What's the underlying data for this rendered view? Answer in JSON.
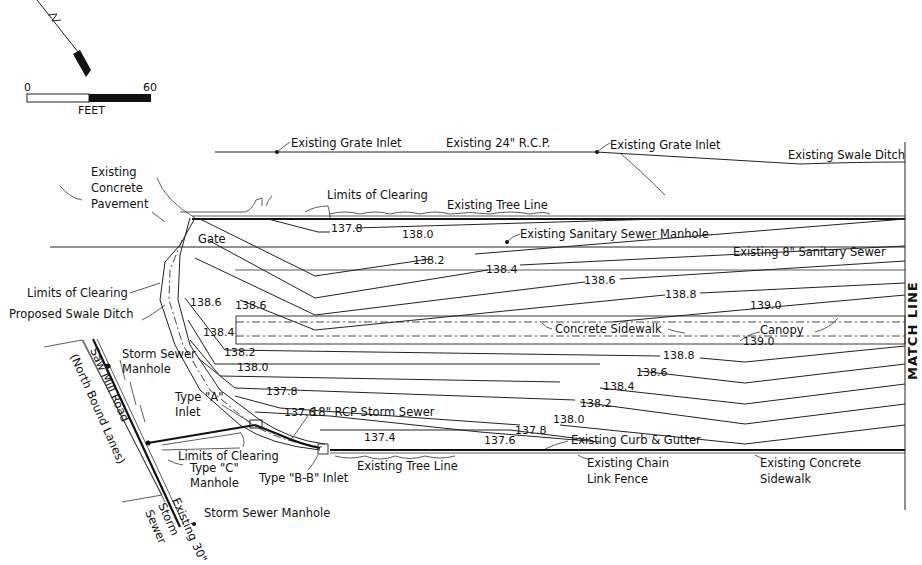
{
  "north_arrow": {
    "letter": "N"
  },
  "scale_bar": {
    "start": "0",
    "end": "60",
    "unit": "FEET"
  },
  "labels": {
    "existing_grate_inlet_1": "Existing Grate Inlet",
    "existing_24_rcp": "Existing 24\" R.C.P.",
    "existing_grate_inlet_2": "Existing Grate Inlet",
    "existing_swale_ditch": "Existing Swale Ditch",
    "existing_concrete_pavement": [
      "Existing",
      "Concrete",
      "Pavement"
    ],
    "limits_of_clearing_top": "Limits of Clearing",
    "existing_tree_line_top": "Existing Tree Line",
    "gate": "Gate",
    "existing_sanitary_sewer_manhole": "Existing Sanitary Sewer Manhole",
    "existing_8_sanitary_sewer": "Existing 8\" Sanitary Sewer",
    "limits_of_clearing_left": "Limits of Clearing",
    "proposed_swale_ditch": "Proposed Swale Ditch",
    "concrete_sidewalk": "Concrete Sidewalk",
    "canopy": "Canopy",
    "storm_sewer_manhole_top": [
      "Storm Sewer",
      "Manhole"
    ],
    "saw_mill_road": [
      "Saw Mill Road",
      "(North Bound Lanes)"
    ],
    "type_a_inlet": [
      "Type \"A\"",
      "Inlet"
    ],
    "rcp_storm_sewer": "18\" RCP Storm Sewer",
    "limits_of_clearing_bottom": "Limits of Clearing",
    "type_c_manhole": [
      "Type \"C\"",
      "Manhole"
    ],
    "type_bb_inlet": "Type \"B-B\" Inlet",
    "existing_tree_line_bottom": "Existing Tree Line",
    "existing_curb_gutter": "Existing Curb & Gutter",
    "existing_chain_link_fence": [
      "Existing Chain",
      "Link Fence"
    ],
    "existing_concrete_sidewalk": [
      "Existing Concrete",
      "Sidewalk"
    ],
    "storm_sewer_manhole_bottom": "Storm Sewer Manhole",
    "existing_30_storm_sewer": [
      "Existing 30\"",
      "Storm",
      "Sewer"
    ],
    "match_line": "MATCH LINE"
  },
  "elevations": {
    "upper": [
      "137.8",
      "138.0",
      "138.2",
      "138.4",
      "138.6",
      "138.8",
      "139.0"
    ],
    "left": [
      "138.6",
      "138.6",
      "138.4"
    ],
    "canopy": "139.0",
    "lower": [
      "138.2",
      "138.0",
      "137.8",
      "137.6",
      "137.4",
      "137.6",
      "137.8",
      "138.0",
      "138.2",
      "138.4",
      "138.6",
      "138.8"
    ]
  }
}
